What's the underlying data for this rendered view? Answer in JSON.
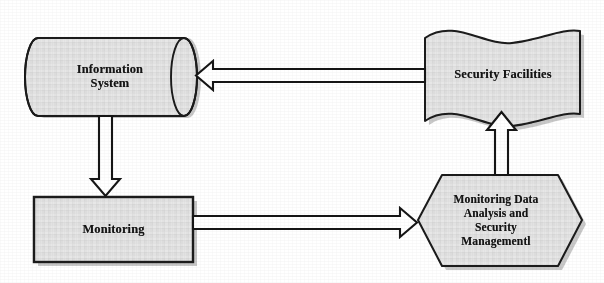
{
  "diagram": {
    "canvas": {
      "width": 604,
      "height": 283,
      "background": "#ffffff"
    },
    "style": {
      "node_fill": "#e2e2e2",
      "node_stroke": "#1a1a1a",
      "shadow": "#9a9a9a",
      "arrow_fill": "#ffffff",
      "arrow_stroke": "#151515",
      "text_color": "#151515"
    },
    "nodes": [
      {
        "id": "information-system",
        "shape": "cylinder",
        "label": "Information\nSystem"
      },
      {
        "id": "security-facilities",
        "shape": "flag-wave",
        "label": "Security Facilities"
      },
      {
        "id": "monitoring",
        "shape": "rectangle",
        "label": "Monitoring"
      },
      {
        "id": "monitoring-data-analysis",
        "shape": "hexagon",
        "label": "Monitoring Data\nAnalysis and\nSecurity\nManagementl"
      }
    ],
    "connectors": [
      {
        "id": "security-facilities-to-information-system",
        "from": "security-facilities",
        "to": "information-system",
        "direction": "left",
        "style": "hollow-block-arrow"
      },
      {
        "id": "information-system-to-monitoring",
        "from": "information-system",
        "to": "monitoring",
        "direction": "down",
        "style": "hollow-block-arrow"
      },
      {
        "id": "monitoring-to-analysis",
        "from": "monitoring",
        "to": "monitoring-data-analysis",
        "direction": "right",
        "style": "hollow-block-arrow"
      },
      {
        "id": "analysis-to-security-facilities",
        "from": "monitoring-data-analysis",
        "to": "security-facilities",
        "direction": "up",
        "style": "hollow-block-arrow"
      }
    ]
  }
}
